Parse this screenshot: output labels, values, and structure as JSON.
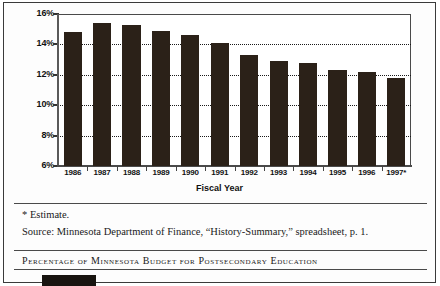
{
  "chart_data": {
    "type": "bar",
    "title": "",
    "xlabel": "Fiscal Year",
    "ylabel": "",
    "categories": [
      "1986",
      "1987",
      "1988",
      "1989",
      "1990",
      "1991",
      "1992",
      "1993",
      "1994",
      "1995",
      "1996",
      "1997*"
    ],
    "values": [
      14.8,
      15.4,
      15.3,
      14.9,
      14.6,
      14.1,
      13.3,
      12.9,
      12.8,
      12.3,
      12.2,
      11.8
    ],
    "ylim": [
      6,
      16
    ],
    "ytick_labels": [
      "16%",
      "14%",
      "12%",
      "10%",
      "8%",
      "6%"
    ],
    "ytick_values": [
      16,
      14,
      12,
      10,
      8,
      6
    ],
    "grid": true,
    "legend": "none",
    "bar_color": "#2b2118"
  },
  "figure": {
    "axis_title": "Fiscal Year"
  },
  "notes": {
    "estimate": "* Estimate.",
    "source": "Source: Minnesota Department of Finance, “History-Summary,” spreadsheet, p. 1."
  },
  "caption": {
    "text": "Percentage of Minnesota Budget for Postsecondary Education"
  }
}
